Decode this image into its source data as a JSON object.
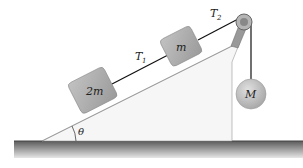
{
  "diagram": {
    "type": "physics-incline-pulley",
    "labels": {
      "block_lower": "2m",
      "block_upper": "m",
      "hanging_mass": "M",
      "tension_1": "T",
      "tension_1_sub": "1",
      "tension_2": "T",
      "tension_2_sub": "2",
      "angle": "θ"
    },
    "colors": {
      "block_fill": "#a8a8a8",
      "sphere_fill": "#bdbdbd",
      "incline_fill": "#f6f6f6",
      "ground_top": "#5a5a5a",
      "ground_bottom": "#e0e0e0",
      "rope": "#111111"
    }
  }
}
